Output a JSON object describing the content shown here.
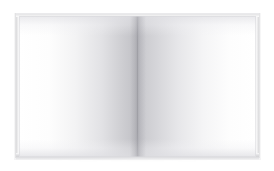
{
  "scene": {
    "subject": "open-blank-book",
    "description": "Open blank hardcover book photographed from directly above on a plain white background",
    "background_color": "#ffffff",
    "canvas": {
      "width": 274,
      "height": 171
    }
  },
  "book": {
    "state": "open",
    "visible_text": "",
    "page_count_visible": 2,
    "bounds": {
      "x": 14,
      "y": 13,
      "width": 247,
      "height": 147
    },
    "parts": [
      {
        "name": "left-page",
        "label": "",
        "color": "#ffffff"
      },
      {
        "name": "right-page",
        "label": "",
        "color": "#ffffff"
      },
      {
        "name": "center-gutter",
        "label": "",
        "color": "#8a8a91"
      },
      {
        "name": "left-page-edge",
        "label": "",
        "color": "#d9d9db"
      },
      {
        "name": "right-page-edge",
        "label": "",
        "color": "#dbdbdd"
      },
      {
        "name": "bottom-page-edge",
        "label": "",
        "color": "#d5d5d8"
      },
      {
        "name": "top-page-edge",
        "label": "",
        "color": "#e3e3e5"
      }
    ]
  },
  "colors": {
    "background": "#ffffff",
    "page_white": "#ffffff",
    "page_shade": "#c0c0c5",
    "gutter_shadow": "#8a8a91",
    "cover": "#f4f4f5",
    "edge_gray": "#d5d5d8",
    "contact_shadow": "rgba(120,120,124,0.30)"
  }
}
